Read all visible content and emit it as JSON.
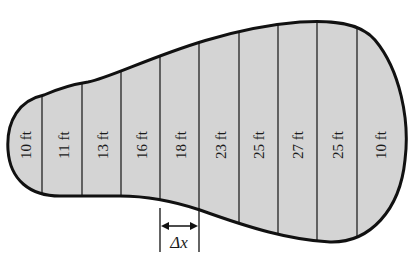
{
  "diagram": {
    "fill_color": "#d4d4d4",
    "outline_color": "#111111",
    "strips": [
      {
        "label": "10 ft",
        "cx": 26
      },
      {
        "label": "11 ft",
        "cx": 64
      },
      {
        "label": "13 ft",
        "cx": 103
      },
      {
        "label": "16 ft",
        "cx": 142
      },
      {
        "label": "18 ft",
        "cx": 181
      },
      {
        "label": "23 ft",
        "cx": 221
      },
      {
        "label": "25 ft",
        "cx": 259
      },
      {
        "label": "27 ft",
        "cx": 298
      },
      {
        "label": "25 ft",
        "cx": 338
      },
      {
        "label": "10 ft",
        "cx": 381
      }
    ],
    "delta_label": "Δx"
  }
}
